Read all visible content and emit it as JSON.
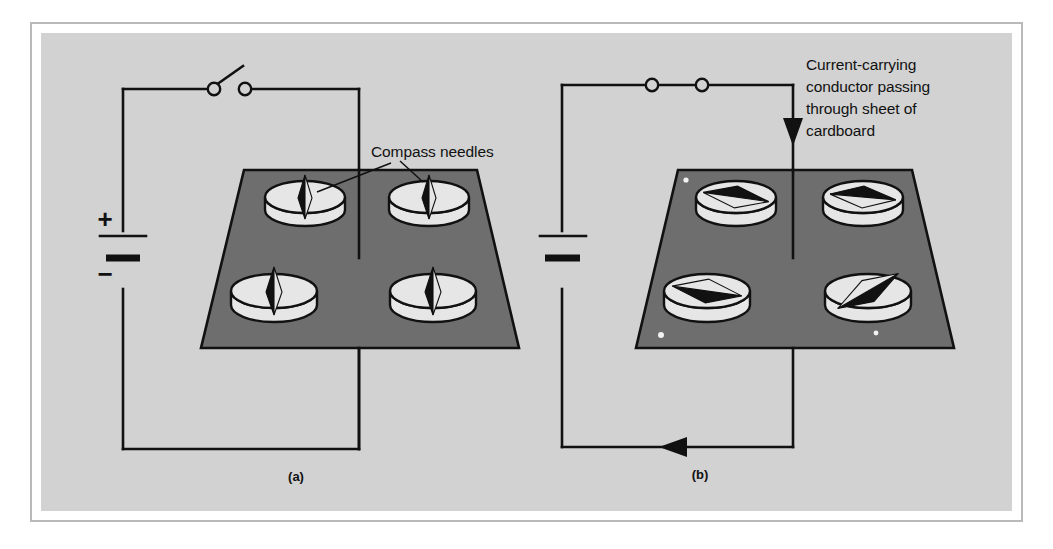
{
  "figure": {
    "title_visible": false,
    "background_color": "#d2d2d2",
    "board_color": "#6e6e6e",
    "ink_color": "#111111",
    "compass_color": "#e6e6e6",
    "frame_color": "#b9b9b9"
  },
  "annotations": {
    "compass_needles_label": "Compass needles",
    "conductor_label_lines": [
      "Current-carrying",
      "conductor  passing",
      "through sheet of",
      "cardboard"
    ]
  },
  "panels": [
    {
      "id": "a",
      "caption": "(a)",
      "switch_state": "open",
      "current_flowing": false,
      "battery": {
        "plus_label": "+",
        "minus_label": "−",
        "labels_shown": true
      },
      "needle_bearings_deg": [
        90,
        90,
        90,
        90
      ],
      "needle_positions": [
        "top-left",
        "top-right",
        "bottom-left",
        "bottom-right"
      ]
    },
    {
      "id": "b",
      "caption": "(b)",
      "switch_state": "closed",
      "current_flowing": true,
      "battery": {
        "plus_label": "",
        "minus_label": "",
        "labels_shown": false
      },
      "needle_bearings_deg": [
        8,
        5,
        188,
        35
      ],
      "needle_positions": [
        "top-left",
        "top-right",
        "bottom-left",
        "bottom-right"
      ],
      "conductor_arrow_direction": "down",
      "return_wire_arrow_direction": "left"
    }
  ]
}
